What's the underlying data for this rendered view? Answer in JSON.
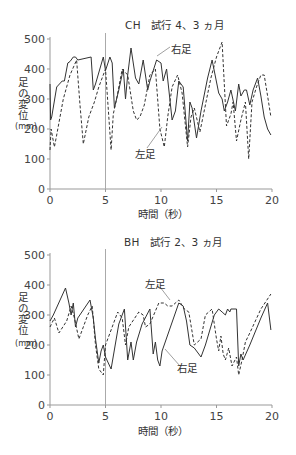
{
  "chart_data": [
    {
      "type": "line",
      "title": "CH　試行 4、3 ヵ月",
      "xlabel": "時間（秒）",
      "ylabel": "足の変位",
      "yunit": "mm",
      "xlim": [
        0,
        20
      ],
      "ylim": [
        0,
        500
      ],
      "xticks": [
        "0",
        "5",
        "10",
        "15",
        "20"
      ],
      "yticks": [
        "0",
        "100",
        "200",
        "300",
        "400",
        "500"
      ],
      "grid": false,
      "reference_line_x": 5,
      "annotations": [
        {
          "text": "右足",
          "series": "右足"
        },
        {
          "text": "左足",
          "series": "左足"
        }
      ],
      "series": [
        {
          "name": "右足",
          "style": "solid",
          "x": [
            0,
            0.05,
            0.15,
            0.6,
            1.1,
            1.3,
            1.6,
            1.8,
            2.1,
            2.3,
            2.5,
            3.7,
            3.9,
            4.1,
            4.8,
            5.0,
            5.4,
            5.6,
            5.8,
            6.2,
            6.6,
            6.8,
            7.0,
            7.3,
            7.7,
            8.0,
            8.4,
            8.8,
            9.0,
            9.6,
            10.0,
            10.2,
            10.5,
            11.0,
            11.3,
            11.6,
            12.0,
            12.4,
            12.6,
            12.8,
            13.2,
            13.6,
            14.2,
            14.6,
            15.2,
            15.5,
            15.7,
            16.0,
            16.3,
            16.7,
            17.0,
            17.2,
            17.5,
            17.7,
            18.0,
            18.3,
            18.7,
            19.0,
            19.3,
            19.6,
            19.9
          ],
          "y": [
            350,
            230,
            240,
            340,
            360,
            360,
            420,
            425,
            440,
            440,
            430,
            440,
            330,
            350,
            440,
            395,
            440,
            420,
            270,
            330,
            400,
            300,
            380,
            470,
            370,
            350,
            430,
            330,
            360,
            430,
            420,
            360,
            400,
            230,
            260,
            360,
            340,
            160,
            290,
            270,
            170,
            260,
            370,
            430,
            320,
            300,
            260,
            290,
            330,
            260,
            350,
            310,
            330,
            330,
            280,
            330,
            370,
            310,
            240,
            200,
            180
          ]
        },
        {
          "name": "左足",
          "style": "dashed",
          "x": [
            0,
            0.1,
            0.2,
            0.4,
            0.6,
            1.2,
            1.8,
            2.4,
            2.7,
            3.0,
            3.5,
            4.0,
            4.4,
            5.0,
            5.5,
            5.7,
            6.0,
            6.5,
            7.0,
            7.5,
            7.8,
            8.1,
            8.5,
            9.0,
            9.5,
            9.9,
            10.3,
            10.6,
            11.0,
            11.5,
            11.9,
            12.4,
            12.7,
            13.0,
            13.5,
            14.0,
            14.5,
            15.0,
            15.5,
            15.9,
            16.3,
            16.5,
            16.8,
            17.2,
            17.6,
            17.9,
            18.2,
            18.6,
            19.0,
            19.3,
            19.6,
            19.9
          ],
          "y": [
            130,
            200,
            180,
            140,
            180,
            300,
            380,
            430,
            280,
            150,
            240,
            290,
            340,
            400,
            130,
            250,
            300,
            400,
            380,
            260,
            230,
            240,
            280,
            380,
            400,
            200,
            140,
            240,
            340,
            380,
            320,
            140,
            240,
            270,
            190,
            280,
            370,
            440,
            490,
            210,
            250,
            290,
            160,
            230,
            290,
            100,
            290,
            340,
            380,
            380,
            310,
            240
          ]
        }
      ]
    },
    {
      "type": "line",
      "title": "BH　試行 2、3 ヵ月",
      "xlabel": "時間（秒）",
      "ylabel": "足の変位",
      "yunit": "mm",
      "xlim": [
        0,
        20
      ],
      "ylim": [
        0,
        500
      ],
      "xticks": [
        "0",
        "5",
        "10",
        "15",
        "20"
      ],
      "yticks": [
        "0",
        "100",
        "200",
        "300",
        "400",
        "500"
      ],
      "grid": false,
      "reference_line_x": 5,
      "annotations": [
        {
          "text": "左足",
          "series": "左足"
        },
        {
          "text": "右足",
          "series": "右足"
        }
      ],
      "series": [
        {
          "name": "右足",
          "style": "solid",
          "x": [
            0,
            0.3,
            1.4,
            1.7,
            1.9,
            2.1,
            2.3,
            2.5,
            3.6,
            3.9,
            4.1,
            4.4,
            4.6,
            4.8,
            5.0,
            5.5,
            6.2,
            6.7,
            7.0,
            7.3,
            7.5,
            7.8,
            8.3,
            9.0,
            9.3,
            9.5,
            9.7,
            9.9,
            10.1,
            11.6,
            12.0,
            12.3,
            12.6,
            13.0,
            13.6,
            14.0,
            14.8,
            15.2,
            15.5,
            15.8,
            16.0,
            16.2,
            16.3,
            16.8,
            17.0,
            17.2,
            17.4,
            18.0,
            19.0,
            19.6,
            19.9
          ],
          "y": [
            280,
            300,
            390,
            340,
            300,
            340,
            260,
            290,
            350,
            290,
            220,
            140,
            180,
            200,
            160,
            120,
            270,
            320,
            150,
            210,
            150,
            210,
            270,
            320,
            170,
            210,
            150,
            130,
            180,
            340,
            330,
            280,
            200,
            190,
            160,
            200,
            300,
            320,
            310,
            300,
            320,
            310,
            320,
            320,
            130,
            170,
            150,
            200,
            290,
            340,
            250
          ]
        },
        {
          "name": "左足",
          "style": "dashed",
          "x": [
            0,
            0.4,
            0.8,
            1.5,
            1.9,
            2.2,
            2.6,
            3.4,
            3.8,
            4.1,
            4.4,
            4.8,
            5.0,
            5.5,
            6.1,
            6.5,
            6.8,
            7.1,
            8.0,
            8.4,
            8.6,
            9.0,
            9.8,
            10.3,
            10.6,
            11.0,
            11.6,
            12.1,
            12.5,
            13.0,
            13.6,
            14.0,
            14.6,
            15.0,
            15.2,
            15.4,
            15.6,
            15.8,
            16.1,
            16.4,
            16.8,
            17.0,
            17.3,
            17.6,
            18.0,
            19.0,
            19.9
          ],
          "y": [
            260,
            290,
            240,
            280,
            330,
            290,
            220,
            300,
            330,
            200,
            120,
            100,
            200,
            250,
            310,
            290,
            200,
            260,
            310,
            300,
            260,
            270,
            340,
            340,
            330,
            330,
            350,
            320,
            310,
            200,
            220,
            300,
            320,
            220,
            180,
            230,
            170,
            150,
            190,
            130,
            160,
            100,
            150,
            210,
            240,
            320,
            370
          ]
        }
      ]
    }
  ]
}
